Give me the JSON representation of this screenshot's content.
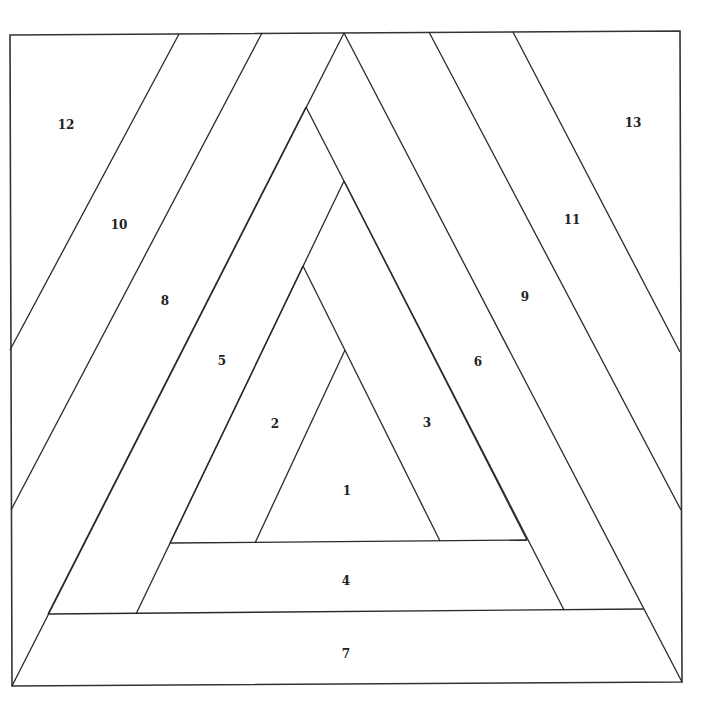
{
  "diagram": {
    "type": "paper-piecing-pattern",
    "stroke_color": "#2a2a2a",
    "background": "#ffffff",
    "pieces": [
      {
        "id": "1",
        "label": "1",
        "x": 347,
        "y": 491
      },
      {
        "id": "2",
        "label": "2",
        "x": 275,
        "y": 424
      },
      {
        "id": "3",
        "label": "3",
        "x": 427,
        "y": 423
      },
      {
        "id": "4",
        "label": "4",
        "x": 346,
        "y": 581
      },
      {
        "id": "5",
        "label": "5",
        "x": 222,
        "y": 361
      },
      {
        "id": "6",
        "label": "6",
        "x": 478,
        "y": 362
      },
      {
        "id": "7",
        "label": "7",
        "x": 346,
        "y": 654
      },
      {
        "id": "8",
        "label": "8",
        "x": 165,
        "y": 301
      },
      {
        "id": "9",
        "label": "9",
        "x": 525,
        "y": 297
      },
      {
        "id": "10",
        "label": "10",
        "x": 119,
        "y": 225
      },
      {
        "id": "11",
        "label": "11",
        "x": 572,
        "y": 220
      },
      {
        "id": "12",
        "label": "12",
        "x": 66,
        "y": 125
      },
      {
        "id": "13",
        "label": "13",
        "x": 633,
        "y": 123
      }
    ]
  }
}
